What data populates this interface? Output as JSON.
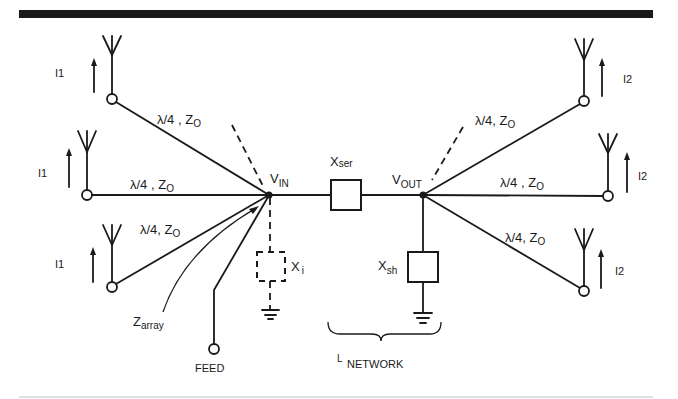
{
  "diagram": {
    "type": "circuit-schematic",
    "colors": {
      "ink": "#1a1a1a",
      "background": "#ffffff"
    },
    "nodes": {
      "vin": {
        "label": "V",
        "sub": "IN"
      },
      "vout": {
        "label": "V",
        "sub": "OUT"
      }
    },
    "components": {
      "xser": {
        "label": "X",
        "sub": "ser"
      },
      "xsh": {
        "label": "X",
        "sub": "sh"
      },
      "xi": {
        "label": "X",
        "sub": "i"
      }
    },
    "lines": {
      "left_top": "λ/4 , Z",
      "left_mid": "λ/4 , Z",
      "left_bot": "λ/4, Z",
      "right_top": "λ/4, Z",
      "right_mid": "λ/4 , Z",
      "right_bot": "λ/4, Z",
      "z_sub": "O"
    },
    "antennas": {
      "left": [
        "I1",
        "I1",
        "I1"
      ],
      "right": [
        "I2",
        "I2",
        "I2"
      ]
    },
    "zarray": {
      "label": "Z",
      "sub": "array"
    },
    "feed": {
      "label": "FEED"
    },
    "network": {
      "prefix": "L",
      "label": "NETWORK"
    }
  }
}
